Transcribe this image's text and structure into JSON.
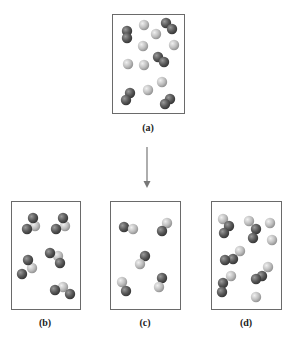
{
  "diagram": {
    "panels": [
      {
        "id": "a",
        "label": "(a)",
        "description": "mixture of separate light atoms and dark diatomic molecules",
        "light_atoms": 8,
        "dark_diatomic_molecules": 5,
        "particles": [
          {
            "kind": "dark-pair"
          },
          {
            "kind": "light"
          },
          {
            "kind": "dark-pair"
          },
          {
            "kind": "light"
          },
          {
            "kind": "light"
          },
          {
            "kind": "light"
          },
          {
            "kind": "dark-pair"
          },
          {
            "kind": "light"
          },
          {
            "kind": "light"
          },
          {
            "kind": "light"
          },
          {
            "kind": "light"
          },
          {
            "kind": "dark-pair"
          },
          {
            "kind": "dark-pair"
          }
        ]
      },
      {
        "id": "b",
        "label": "(b)",
        "description": "triatomic molecules: one light atom bonded between two dark atoms",
        "molecules": 5,
        "molecule_type": "dark-light-dark"
      },
      {
        "id": "c",
        "label": "(c)",
        "description": "diatomic molecules of one dark and one light atom",
        "molecules": 5,
        "molecule_type": "dark-light"
      },
      {
        "id": "d",
        "label": "(d)",
        "description": "mixture of dark-dark-light molecules and separate light atoms",
        "molecule_type": "mixed"
      }
    ],
    "arrow": {
      "direction": "down",
      "from": "a",
      "to": "c"
    },
    "colors": {
      "light_atom": "#bdbdbd",
      "light_atom_highlight": "#ececec",
      "dark_atom": "#5a5a5a",
      "dark_atom_highlight": "#9a9a9a",
      "box_border": "#6a6a6a",
      "arrow": "#777777"
    }
  }
}
